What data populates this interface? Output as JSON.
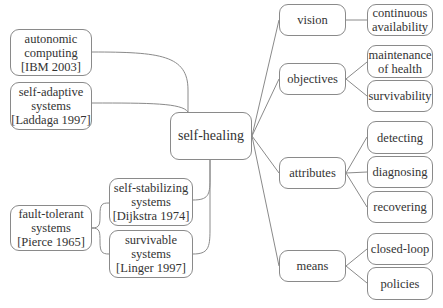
{
  "diagram": {
    "center": {
      "label": "self-healing"
    },
    "left_nodes": {
      "autonomic": {
        "label": "autonomic\ncomputing\n[IBM 2003]"
      },
      "self_adaptive": {
        "label": "self-adaptive\nsystems\n[Laddaga 1997]"
      },
      "fault_tolerant": {
        "label": "fault-tolerant\nsystems\n[Pierce 1965]"
      },
      "self_stabilizing": {
        "label": "self-stabilizing\nsystems\n[Dijkstra 1974]"
      },
      "survivable": {
        "label": "survivable\nsystems\n[Linger 1997]"
      }
    },
    "categories": {
      "vision": {
        "label": "vision",
        "children": [
          {
            "label": "continuous\navailability"
          }
        ]
      },
      "objectives": {
        "label": "objectives",
        "children": [
          {
            "label": "maintenance\nof health"
          },
          {
            "label": "survivability"
          }
        ]
      },
      "attributes": {
        "label": "attributes",
        "children": [
          {
            "label": "detecting"
          },
          {
            "label": "diagnosing"
          },
          {
            "label": "recovering"
          }
        ]
      },
      "means": {
        "label": "means",
        "children": [
          {
            "label": "closed-loop"
          },
          {
            "label": "policies"
          }
        ]
      }
    }
  }
}
